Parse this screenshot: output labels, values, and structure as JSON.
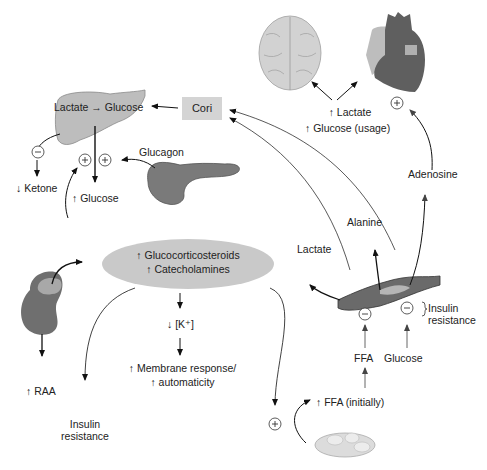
{
  "liver": {
    "label": "Lactate → Glucose"
  },
  "cori": {
    "label": "Cori"
  },
  "ketone": {
    "label": "↓ Ketone"
  },
  "glucose_up": {
    "label": "↑ Glucose"
  },
  "glucagon": {
    "label": "Glucagon"
  },
  "brain_heart": {
    "lactate": "↑ Lactate",
    "glucose_usage": "↑ Glucose (usage)"
  },
  "adenosine": {
    "label": "Adenosine"
  },
  "alanine": {
    "label": "Alanine"
  },
  "lactate_muscle": {
    "label": "Lactate"
  },
  "hormones": {
    "line1": "↑ Glucocorticosteroids",
    "line2": "↑ Catecholamines"
  },
  "potassium": {
    "label": "↓ [K⁺]"
  },
  "membrane": {
    "line1": "↑ Membrane response/",
    "line2": "↑ automaticity"
  },
  "raa": {
    "label": "↑ RAA"
  },
  "insulin_resistance_left": {
    "line1": "Insulin",
    "line2": "resistance"
  },
  "insulin_resistance_right": {
    "line1": "Insulin",
    "line2": "resistance"
  },
  "ffa": {
    "label": "FFA"
  },
  "glucose_muscle": {
    "label": "Glucose"
  },
  "ffa_initially": {
    "label": "↑ FFA (initially)"
  },
  "signs": {
    "plus": "+",
    "minus": "−"
  },
  "colors": {
    "organ_dark": "#6b6b6b",
    "organ_mid": "#9a9a9a",
    "organ_light": "#c8c8c8",
    "cori_box": "#d4d4d4",
    "ellipse": "#c9c9c9"
  }
}
